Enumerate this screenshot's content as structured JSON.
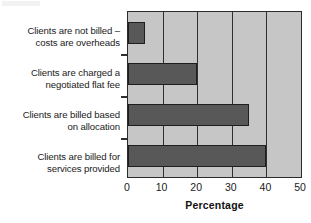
{
  "chart_data": {
    "type": "bar",
    "orientation": "horizontal",
    "title": "",
    "xlabel": "Percentage",
    "ylabel": "",
    "xlim": [
      0,
      50
    ],
    "xticks": [
      0,
      10,
      20,
      30,
      40,
      50
    ],
    "xtick_labels": [
      "0",
      "10",
      "20",
      "30",
      "40",
      "50"
    ],
    "grid": true,
    "grid_axis": "x",
    "legend": false,
    "categories": [
      "Clients are not billed – costs are overheads",
      "Clients are charged a negotiated flat fee",
      "Clients are billed based on allocation",
      "Clients are billed for services provided"
    ],
    "category_lines": [
      [
        "Clients are not billed –",
        "costs are overheads"
      ],
      [
        "Clients are charged a",
        "negotiated flat fee"
      ],
      [
        "Clients are billed based",
        "on allocation"
      ],
      [
        "Clients are billed for",
        "services provided"
      ]
    ],
    "values": [
      5,
      20,
      35,
      40
    ],
    "colors": {
      "bar_fill": "#585858",
      "bar_edge": "#1e1e1e",
      "plot_background": "#c6c6c6",
      "axis": "#2b2b2b",
      "gridline": "#2f2f2f",
      "text": "#1b1b1b",
      "page_background": "#ffffff"
    }
  }
}
